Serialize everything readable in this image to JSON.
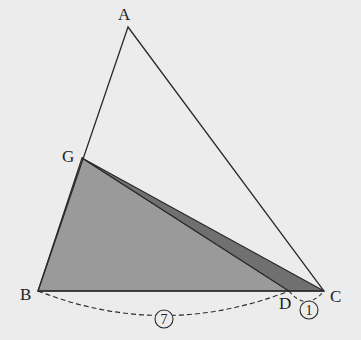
{
  "diagram": {
    "points": {
      "A": {
        "label": "A",
        "x": 128,
        "y": 27
      },
      "B": {
        "label": "B",
        "x": 38,
        "y": 291
      },
      "C": {
        "label": "C",
        "x": 324,
        "y": 291
      },
      "D": {
        "label": "D",
        "x": 289,
        "y": 291
      },
      "G": {
        "label": "G",
        "x": 82,
        "y": 158
      }
    },
    "ratios": {
      "BD": "7",
      "DC": "1"
    },
    "colors": {
      "background": "#ececec",
      "light_shade": "#9a9a9a",
      "dark_shade": "#707070",
      "line": "#2a2a2a"
    }
  }
}
